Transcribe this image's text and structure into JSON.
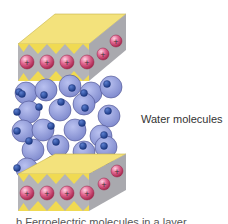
{
  "diagram": {
    "labels": {
      "water": "Water molecules",
      "caption_partial": "b  Ferroelectric molecules in a layer"
    },
    "colors": {
      "plate_top": "#f2e27a",
      "plate_side": "#b0b0b4",
      "plate_edge": "#d9c94a",
      "triangle": "#f0dc5a",
      "cation": "#d94b7a",
      "cation_highlight": "#f4a3c1",
      "oxygen": "#8d97d6",
      "oxygen_edge": "#4a4f8f",
      "hydrogen": "#2b4ea0"
    },
    "cation_symbol": "+"
  }
}
